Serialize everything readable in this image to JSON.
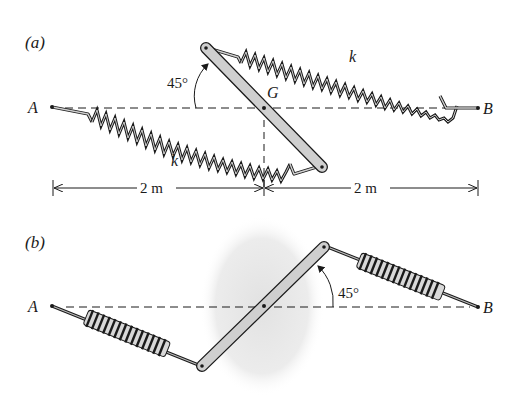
{
  "figure_a": {
    "label": "(a)",
    "point_a": "A",
    "point_b": "B",
    "center_label": "G",
    "angle_label": "45°",
    "spring_top_label": "k",
    "spring_bottom_label": "k",
    "dim_left": "2 m",
    "dim_right": "2 m"
  },
  "figure_b": {
    "label": "(b)",
    "point_a": "A",
    "point_b": "B",
    "angle_label": "45°"
  },
  "colors": {
    "ink": "#1a1a1a",
    "bar_fill": "#cfcfcf",
    "shade": "#e6e6e6"
  }
}
